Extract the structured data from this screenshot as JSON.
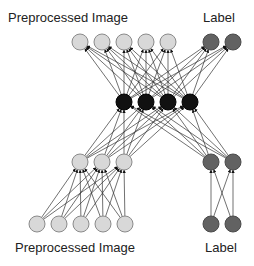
{
  "labels": {
    "top_image": "Preprocessed Image",
    "top_label": "Label",
    "bottom_image": "Preprocessed Image",
    "bottom_label": "Label"
  },
  "colors": {
    "light_node": "#d8d8d8",
    "light_stroke": "#8a8a8a",
    "dark_node": "#626262",
    "dark_stroke": "#4a4a4a",
    "hidden_node": "#111111",
    "edge": "#333333"
  },
  "layers": {
    "top_image": [
      [
        80,
        42
      ],
      [
        102,
        42
      ],
      [
        124,
        42
      ],
      [
        146,
        42
      ],
      [
        168,
        42
      ]
    ],
    "top_label": [
      [
        211,
        42
      ],
      [
        233,
        42
      ]
    ],
    "hidden": [
      [
        124,
        102
      ],
      [
        146,
        102
      ],
      [
        168,
        102
      ],
      [
        190,
        102
      ]
    ],
    "mid_image": [
      [
        80,
        162
      ],
      [
        102,
        162
      ],
      [
        124,
        162
      ]
    ],
    "mid_label": [
      [
        211,
        162
      ],
      [
        233,
        162
      ]
    ],
    "bottom_image": [
      [
        37,
        224
      ],
      [
        59,
        224
      ],
      [
        81,
        224
      ],
      [
        103,
        224
      ],
      [
        125,
        224
      ]
    ],
    "bottom_label": [
      [
        211,
        224
      ],
      [
        233,
        224
      ]
    ]
  },
  "node_radius": 8
}
